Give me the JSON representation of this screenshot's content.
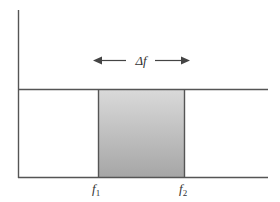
{
  "diagram": {
    "type": "ideal bandpass filter / frequency band",
    "bandwidth_label": "Δf",
    "band_start_label": {
      "base": "f",
      "sub": "1"
    },
    "band_end_label": {
      "base": "f",
      "sub": "2"
    },
    "colors": {
      "axis": "#555555",
      "band_top": "#dadada",
      "band_bottom": "#a6a6a6",
      "text": "#333333"
    }
  }
}
